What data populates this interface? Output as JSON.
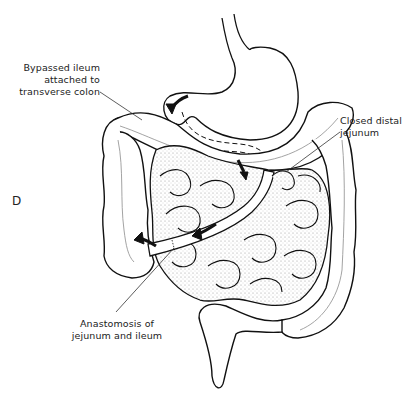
{
  "figure": {
    "panel_letter": "D",
    "labels": {
      "bypassed_line1": "Bypassed ileum",
      "bypassed_line2": "attached to",
      "bypassed_line3": "transverse colon",
      "closed_line1": "Closed distal",
      "closed_line2": "jejunum",
      "anast_line1": "Anastomosis of",
      "anast_line2": "jejunum and ileum"
    },
    "colors": {
      "ink": "#111111",
      "stipple": "#d9d9d9",
      "vessel": "#999999"
    }
  }
}
